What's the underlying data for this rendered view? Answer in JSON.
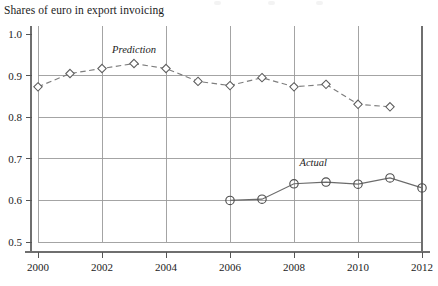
{
  "chart_data": {
    "type": "line",
    "title": "Shares of euro in export invoicing",
    "xlabel": "",
    "ylabel": "",
    "xlim": [
      2000,
      2012
    ],
    "ylim": [
      0.5,
      1.0
    ],
    "xticks": [
      "2000",
      "2002",
      "2004",
      "2006",
      "2008",
      "2010",
      "2012"
    ],
    "yticks": [
      "1.0",
      "0.9",
      "0.8",
      "0.7",
      "0.6",
      "0.5"
    ],
    "grid": "both",
    "legend_position": "inline-annotation",
    "annotations": [
      {
        "text": "Prediction",
        "x": 2003,
        "y": 0.955
      },
      {
        "text": "Actual",
        "x": 2008.6,
        "y": 0.683
      }
    ],
    "series": [
      {
        "name": "Prediction",
        "marker": "diamond",
        "linestyle": "dashed",
        "x": [
          2000,
          2001,
          2002,
          2003,
          2004,
          2005,
          2006,
          2007,
          2008,
          2009,
          2010,
          2011
        ],
        "values": [
          0.873,
          0.905,
          0.917,
          0.929,
          0.917,
          0.886,
          0.876,
          0.895,
          0.873,
          0.879,
          0.831,
          0.825
        ]
      },
      {
        "name": "Actual",
        "marker": "circle",
        "linestyle": "solid",
        "x": [
          2006,
          2007,
          2008,
          2009,
          2010,
          2011,
          2012
        ],
        "values": [
          0.6,
          0.603,
          0.64,
          0.644,
          0.639,
          0.654,
          0.63
        ]
      }
    ]
  },
  "figure": {
    "title": "Shares of euro in export invoicing"
  }
}
